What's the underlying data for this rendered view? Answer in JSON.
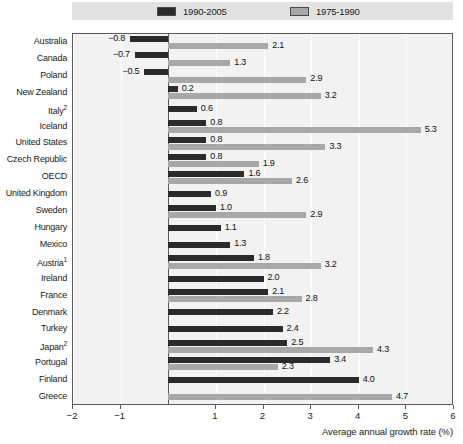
{
  "chart_data": {
    "type": "bar",
    "orientation": "horizontal",
    "title": "",
    "xlabel": "Average annual growth rate (%)",
    "ylabel": "",
    "xlim": [
      -2,
      6
    ],
    "xticks": [
      "-2",
      "-1",
      "1",
      "2",
      "3",
      "4",
      "5",
      "6"
    ],
    "xtick_values": [
      -2,
      -1,
      1,
      2,
      3,
      4,
      5,
      6
    ],
    "grid": true,
    "legend_position": "top",
    "categories": [
      "Australia",
      "Canada",
      "Poland",
      "New Zealand",
      "Italy",
      "Iceland",
      "United States",
      "Czech Republic",
      "OECD",
      "United Kingdom",
      "Sweden",
      "Hungary",
      "Mexico",
      "Austria",
      "Ireland",
      "France",
      "Denmark",
      "Turkey",
      "Japan",
      "Portugal",
      "Finland",
      "Greece"
    ],
    "category_labels_html": [
      "Australia",
      "Canada",
      "Poland",
      "New Zealand",
      "Italy<sup>2</sup>",
      "Iceland",
      "United States",
      "Czech Republic",
      "OECD",
      "United Kingdom",
      "Sweden",
      "Hungary",
      "Mexico",
      "Austria<sup>1</sup>",
      "Ireland",
      "France",
      "Denmark",
      "Turkey",
      "Japan<sup>2</sup>",
      "Portugal",
      "Finland",
      "Greece"
    ],
    "series": [
      {
        "name": "1990-2005",
        "color": "#2b2b2b",
        "values": [
          -0.8,
          -0.7,
          -0.5,
          0.2,
          0.6,
          0.8,
          0.8,
          0.8,
          1.6,
          0.9,
          1.0,
          1.1,
          1.3,
          1.8,
          2.0,
          2.1,
          2.2,
          2.4,
          2.5,
          3.4,
          4.0,
          null
        ],
        "labels": [
          "-0.8",
          "-0.7",
          "-0.5",
          "0.2",
          "0.6",
          "0.8",
          "0.8",
          "0.8",
          "1.6",
          "0.9",
          "1.0",
          "1.1",
          "1.3",
          "1.8",
          "2.0",
          "2.1",
          "2.2",
          "2.4",
          "2.5",
          "3.4",
          "4.0",
          null
        ]
      },
      {
        "name": "1975-1990",
        "color": "#a8a8a8",
        "values": [
          2.1,
          1.3,
          2.9,
          3.2,
          null,
          5.3,
          3.3,
          1.9,
          2.6,
          null,
          2.9,
          null,
          null,
          3.2,
          null,
          2.8,
          null,
          null,
          4.3,
          2.3,
          null,
          4.7
        ],
        "labels": [
          "2.1",
          "1.3",
          "2.9",
          "3.2",
          null,
          "5.3",
          "3.3",
          "1.9",
          "2.6",
          null,
          "2.9",
          null,
          null,
          "3.2",
          null,
          "2.8",
          null,
          null,
          "4.3",
          "2.3",
          null,
          "4.7"
        ]
      }
    ]
  },
  "legend": {
    "entries": [
      {
        "label": "1990-2005",
        "swatch": "dark"
      },
      {
        "label": "1975-1990",
        "swatch": "light"
      }
    ]
  },
  "axis": {
    "title": "Average annual growth rate (%)"
  },
  "colors": {
    "series_dark": "#2b2b2b",
    "series_light": "#a8a8a8",
    "plot_background": "#f2f2f2",
    "legend_background": "#e2e2e2",
    "frame": "#5a5a5a"
  }
}
